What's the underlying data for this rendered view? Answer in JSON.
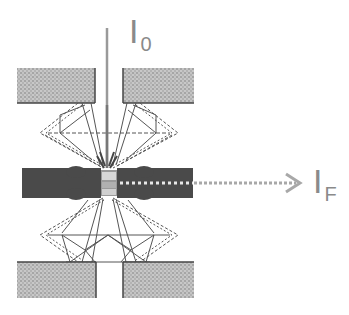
{
  "diagram": {
    "type": "diamond-anvil-cell-schematic",
    "labels": {
      "incident": {
        "main": "I",
        "sub": "0"
      },
      "fluorescence": {
        "main": "I",
        "sub": "F"
      }
    },
    "colors": {
      "background": "#ffffff",
      "block_fill": "#b8b8b8",
      "block_edge": "#555555",
      "gasket": "#4a4a4a",
      "diamond_line": "#555555",
      "beam": "#9a9a9a",
      "label": "#8a8a8a",
      "arrow": "#a8a8a8"
    },
    "components": [
      "upper-backing-plate-left",
      "upper-backing-plate-right",
      "upper-diamond-anvil",
      "gasket",
      "sample-chamber",
      "lower-diamond-anvil",
      "lower-backing-plate-left",
      "lower-backing-plate-right",
      "incident-beam",
      "fluorescence-beam"
    ]
  }
}
